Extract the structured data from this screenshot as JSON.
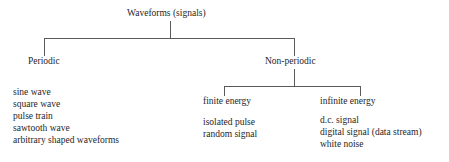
{
  "diagram": {
    "title_text": "Waveforms (signals)",
    "type": "tree-hierarchy",
    "line_color": "#5a5a5a",
    "text_color": "#262626",
    "background": "#ffffff",
    "root": {
      "label": "Waveforms (signals)"
    },
    "level1": {
      "periodic": {
        "label": "Periodic",
        "examples": [
          "sine wave",
          "square wave",
          "pulse train",
          "sawtooth wave",
          "arbitrary shaped waveforms"
        ]
      },
      "nonperiodic": {
        "label": "Non-periodic"
      }
    },
    "level2": {
      "finite_energy": {
        "label": "finite energy",
        "examples": [
          "isolated pulse",
          "random signal"
        ]
      },
      "infinite_energy": {
        "label": "infinite energy",
        "examples": [
          "d.c. signal",
          "digital signal (data stream)",
          "white noise"
        ]
      }
    }
  }
}
